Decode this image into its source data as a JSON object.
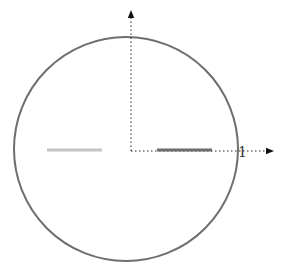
{
  "diagram": {
    "type": "unit-circle-with-axes",
    "circle": {
      "cx": 126,
      "cy": 149,
      "r": 112,
      "stroke": "#6e6e6e",
      "stroke_width": 2
    },
    "origin": {
      "x": 131,
      "y": 151
    },
    "x_axis": {
      "style": "dotted",
      "color": "#222222",
      "end_x": 270,
      "arrow": "right"
    },
    "y_axis": {
      "style": "dotted",
      "color": "#222222",
      "end_y": 14,
      "arrow": "up"
    },
    "x_axis_label": "1",
    "segments": [
      {
        "name": "right-segment",
        "x1": 157,
        "x2": 212,
        "y": 150,
        "color": "#6e6e6e",
        "width": 3
      },
      {
        "name": "left-segment",
        "x1": 47,
        "x2": 102,
        "y": 150,
        "color": "#c4c4c4",
        "width": 3
      }
    ]
  }
}
